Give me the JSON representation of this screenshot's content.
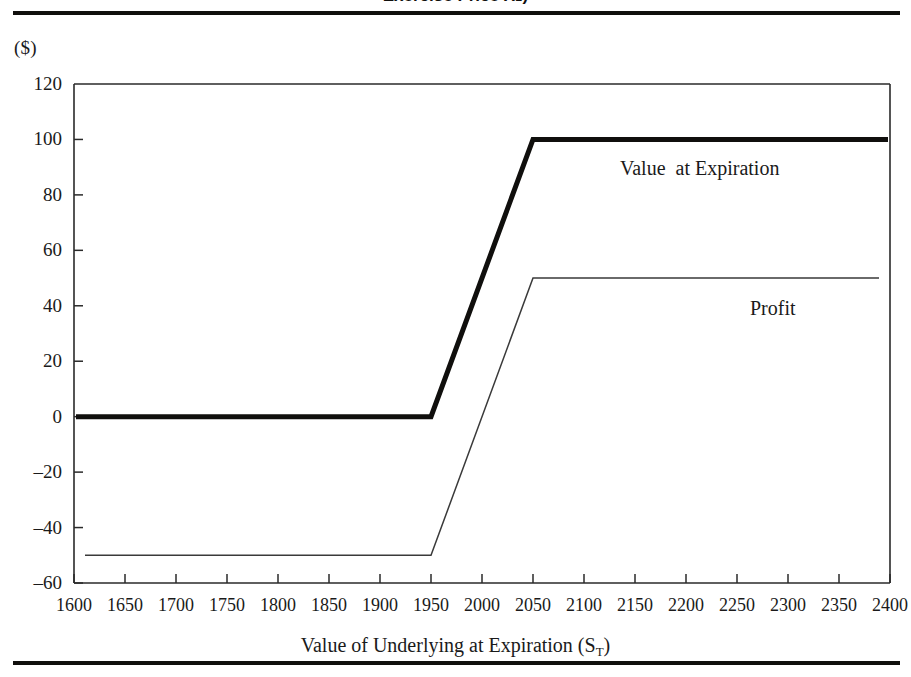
{
  "figure": {
    "caption_sliver": "Exercise Price X₂)",
    "unit_label": "($)",
    "x_axis_title_main": "Value of Underlying at Expiration (S",
    "x_axis_title_sub": "T",
    "x_axis_title_close": ")"
  },
  "chart_data": {
    "type": "line",
    "title": "",
    "xlabel": "Value of Underlying at Expiration (S_T)",
    "ylabel": "($)",
    "xlim": [
      1600,
      2400
    ],
    "ylim": [
      -60,
      120
    ],
    "xticks": [
      1600,
      1650,
      1700,
      1750,
      1800,
      1850,
      1900,
      1950,
      2000,
      2050,
      2100,
      2150,
      2200,
      2250,
      2300,
      2350,
      2400
    ],
    "yticks": [
      120,
      100,
      80,
      60,
      40,
      20,
      0,
      -20,
      -40,
      -60
    ],
    "grid": false,
    "legend": "in-plot annotations",
    "series": [
      {
        "name": "Value at Expiration",
        "style": "thick",
        "color": "#100f0d",
        "linewidth": 5,
        "x": [
          1600,
          1950,
          2050,
          2400
        ],
        "y": [
          0,
          0,
          100,
          100
        ]
      },
      {
        "name": "Profit",
        "style": "thin",
        "color": "#3a3a3a",
        "linewidth": 1.5,
        "x": [
          1600,
          1950,
          2050,
          2400
        ],
        "y": [
          -50,
          -50,
          50,
          50
        ]
      }
    ],
    "annotations": [
      {
        "text": "Value  at Expiration",
        "x": 2130,
        "y": 82
      },
      {
        "text": "Profit",
        "x": 2300,
        "y": 36
      }
    ]
  },
  "y_tick_labels": [
    "120",
    "100",
    "80",
    "60",
    "40",
    "20",
    "0",
    "–20",
    "–40",
    "–60"
  ],
  "x_tick_labels": [
    "1600",
    "1650",
    "1700",
    "1750",
    "1800",
    "1850",
    "1900",
    "1950",
    "2000",
    "2050",
    "2100",
    "2150",
    "2200",
    "2250",
    "2300",
    "2350",
    "2400"
  ],
  "series_labels": {
    "value_at_expiration": "Value  at Expiration",
    "profit": "Profit"
  }
}
